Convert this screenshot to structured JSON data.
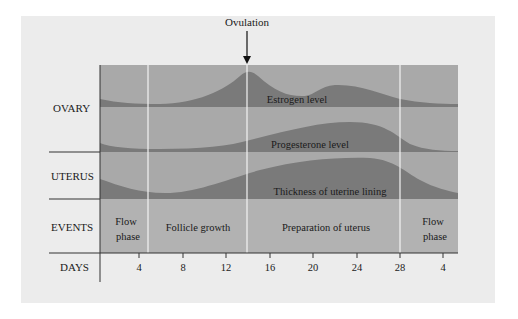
{
  "title_annotation": "Ovulation",
  "row_labels": {
    "ovary": "OVARY",
    "uterus": "UTERUS",
    "events": "EVENTS",
    "days": "DAYS"
  },
  "curve_labels": {
    "estrogen": "Estrogen level",
    "progesterone": "Progesterone level",
    "uterine_lining": "Thickness of uterine lining"
  },
  "events": [
    {
      "label_line1": "Flow",
      "label_line2": "phase"
    },
    {
      "label_line1": "Follicle growth",
      "label_line2": ""
    },
    {
      "label_line1": "Preparation of uterus",
      "label_line2": ""
    },
    {
      "label_line1": "Flow",
      "label_line2": "phase"
    }
  ],
  "day_ticks": [
    "4",
    "8",
    "12",
    "16",
    "20",
    "24",
    "28",
    "4"
  ],
  "colors": {
    "panel_bg": "#ececec",
    "band_bg": "#a9a9a9",
    "curve_fill": "#7a7a7a",
    "events_bg": "#b2b2b2",
    "divider": "#f4f4f4",
    "axis": "#333333"
  }
}
